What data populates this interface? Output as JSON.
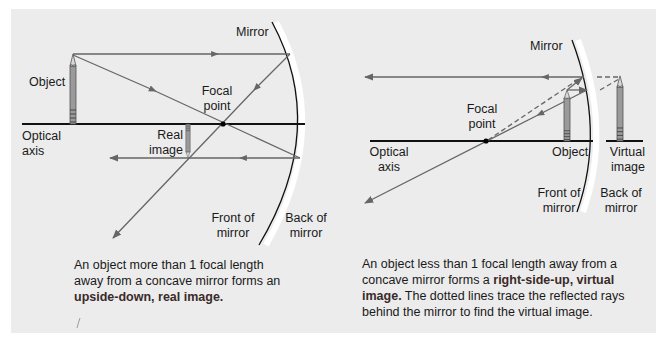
{
  "figure": {
    "background_color": "#ececec",
    "ray_color": "#666666",
    "axis_color": "#111111",
    "pencil_fill": "#9a9a9a"
  },
  "left_diagram": {
    "labels": {
      "mirror": "Mirror",
      "object": "Object",
      "focal_point_line1": "Focal",
      "focal_point_line2": "point",
      "optical_axis_line1": "Optical",
      "optical_axis_line2": "axis",
      "real_image_line1": "Real",
      "real_image_line2": "image",
      "front_of_mirror_line1": "Front of",
      "front_of_mirror_line2": "mirror",
      "back_of_mirror_line1": "Back of",
      "back_of_mirror_line2": "mirror"
    },
    "caption": {
      "text_plain": "An object more than 1 focal length away from a concave mirror forms an ",
      "line1": "An object more than 1 focal length",
      "line2": "away from a concave mirror forms an",
      "bold": "upside-down, real image."
    }
  },
  "right_diagram": {
    "labels": {
      "mirror": "Mirror",
      "focal_point_line1": "Focal",
      "focal_point_line2": "point",
      "optical_axis_line1": "Optical",
      "optical_axis_line2": "axis",
      "object": "Object",
      "virtual_image_line1": "Virtual",
      "virtual_image_line2": "image",
      "front_of_mirror_line1": "Front of",
      "front_of_mirror_line2": "mirror",
      "back_of_mirror_line1": "Back of",
      "back_of_mirror_line2": "mirror"
    },
    "caption": {
      "line1": "An object less than 1 focal length away from a",
      "line2_plain": "concave mirror forms a ",
      "line2_bold": "right-side-up, virtual",
      "line3_bold": "image.",
      "line3_plain": " The dotted lines trace the reflected rays",
      "line4": "behind the mirror to find the virtual image."
    }
  }
}
